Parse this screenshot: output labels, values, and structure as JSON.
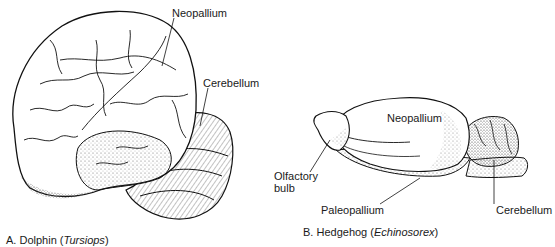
{
  "figure": {
    "panel_a": {
      "caption_letter": "A.",
      "caption_name": "Dolphin (",
      "caption_genus": "Tursiops",
      "caption_close": ")",
      "labels": {
        "neopallium": "Neopallium",
        "cerebellum": "Cerebellum"
      }
    },
    "panel_b": {
      "caption_letter": "B.",
      "caption_name": "Hedgehog (",
      "caption_genus": "Echinosorex",
      "caption_close": ")",
      "labels": {
        "neopallium": "Neopallium",
        "olfactory_bulb_line1": "Olfactory",
        "olfactory_bulb_line2": "bulb",
        "paleopallium": "Paleopallium",
        "cerebellum": "Cerebellum"
      }
    }
  }
}
